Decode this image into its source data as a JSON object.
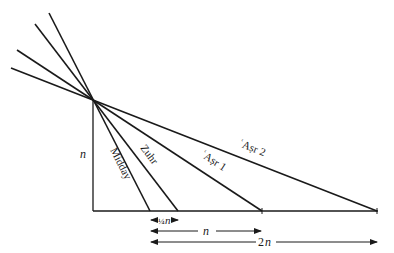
{
  "diagram": {
    "type": "shadow-length diagram for prayer times",
    "gnomon_label": "n",
    "shadow_lines": [
      {
        "id": "midday",
        "label": "Midday"
      },
      {
        "id": "zuhr",
        "label": "Zuhr"
      },
      {
        "id": "asr1",
        "label": "ʿAṣr 1"
      },
      {
        "id": "asr2",
        "label": "ʿAṣr 2"
      }
    ],
    "dimensions": [
      {
        "id": "quarter",
        "label": "¼ n"
      },
      {
        "id": "one",
        "label": "n"
      },
      {
        "id": "two",
        "label": "2n"
      }
    ],
    "colors": {
      "line": "#1a1a1a",
      "background": "#ffffff"
    }
  }
}
